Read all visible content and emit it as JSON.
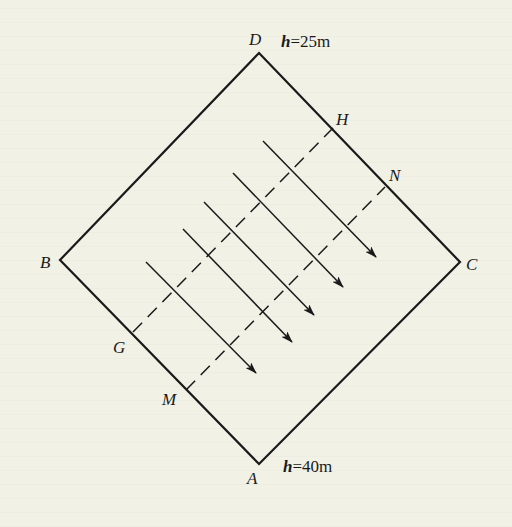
{
  "figure": {
    "type": "square-region-with-flow-arrows",
    "colors": {
      "background": "#f1f1e6",
      "stroke": "#1a1a1a"
    },
    "vertices": {
      "D": {
        "label": "D",
        "x": 259,
        "y": 53
      },
      "C": {
        "label": "C",
        "x": 460,
        "y": 262
      },
      "A": {
        "label": "A",
        "x": 259,
        "y": 464
      },
      "B": {
        "label": "B",
        "x": 60,
        "y": 260
      }
    },
    "heights": {
      "top": {
        "var": "h",
        "text": "=25m"
      },
      "bottom": {
        "var": "h",
        "text": "=40m"
      }
    },
    "dashed_lines": [
      {
        "from": "G",
        "to": "H",
        "x1": 133,
        "y1": 332,
        "x2": 333,
        "y2": 128
      },
      {
        "from": "M",
        "to": "N",
        "x1": 186,
        "y1": 390,
        "x2": 385,
        "y2": 187
      }
    ],
    "points": {
      "G": {
        "label": "G"
      },
      "H": {
        "label": "H"
      },
      "M": {
        "label": "M"
      },
      "N": {
        "label": "N"
      }
    },
    "arrows": [
      {
        "x1": 146,
        "y1": 262,
        "x2": 256,
        "y2": 373
      },
      {
        "x1": 183,
        "y1": 229,
        "x2": 292,
        "y2": 342
      },
      {
        "x1": 204,
        "y1": 202,
        "x2": 314,
        "y2": 315
      },
      {
        "x1": 233,
        "y1": 173,
        "x2": 343,
        "y2": 287
      },
      {
        "x1": 263,
        "y1": 141,
        "x2": 376,
        "y2": 257
      }
    ]
  }
}
